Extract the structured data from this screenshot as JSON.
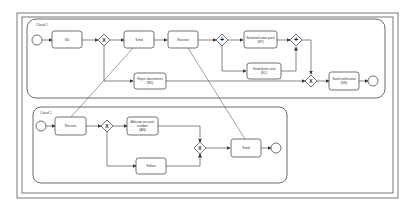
{
  "diagram": {
    "type": "BPMN collaboration",
    "pools": [
      {
        "id": "cloud1",
        "label": "Cloud 1",
        "tasks": [
          {
            "id": "t_sd",
            "label": "SD"
          },
          {
            "id": "t_send1",
            "label": "Send"
          },
          {
            "id": "t_receive1",
            "label": "Receive"
          },
          {
            "id": "t_sp",
            "label_line1": "Send welcome pack",
            "label_line2": "(SP)"
          },
          {
            "id": "t_sc",
            "label_line1": "Send bank card",
            "label_line2": "(SC)"
          },
          {
            "id": "t_rd",
            "label_line1": "Reject documents",
            "label_line2": "(RD)"
          },
          {
            "id": "t_sn",
            "label_line1": "Send notification",
            "label_line2": "(SN)"
          }
        ],
        "gateways": [
          {
            "id": "g1",
            "kind": "exclusive",
            "symbol": "X"
          },
          {
            "id": "g2",
            "kind": "parallel",
            "symbol": "+"
          },
          {
            "id": "g3",
            "kind": "parallel",
            "symbol": "+"
          },
          {
            "id": "g4",
            "kind": "exclusive",
            "symbol": "X"
          }
        ],
        "events": [
          "start",
          "end"
        ]
      },
      {
        "id": "cloud2",
        "label": "Cloud 2",
        "tasks": [
          {
            "id": "t_receive2",
            "label": "Receive"
          },
          {
            "id": "t_aan",
            "label_line1": "Allocate account",
            "label_line2": "number",
            "label_line3": "(AN)"
          },
          {
            "id": "t_follow",
            "label": "Follow"
          },
          {
            "id": "t_send2",
            "label": "Send"
          }
        ],
        "gateways": [
          {
            "id": "g5",
            "kind": "exclusive",
            "symbol": "X"
          },
          {
            "id": "g6",
            "kind": "exclusive",
            "symbol": "X"
          }
        ],
        "events": [
          "start",
          "end"
        ]
      }
    ],
    "message_flows": [
      {
        "from": "cloud1.Send",
        "to": "cloud2.Receive"
      },
      {
        "from": "cloud1.Receive",
        "to": "cloud2.Send"
      }
    ],
    "colors": {
      "stroke": "#3a3a3a",
      "frame": "#555555",
      "fill": "#ffffff",
      "text": "#333333"
    }
  }
}
